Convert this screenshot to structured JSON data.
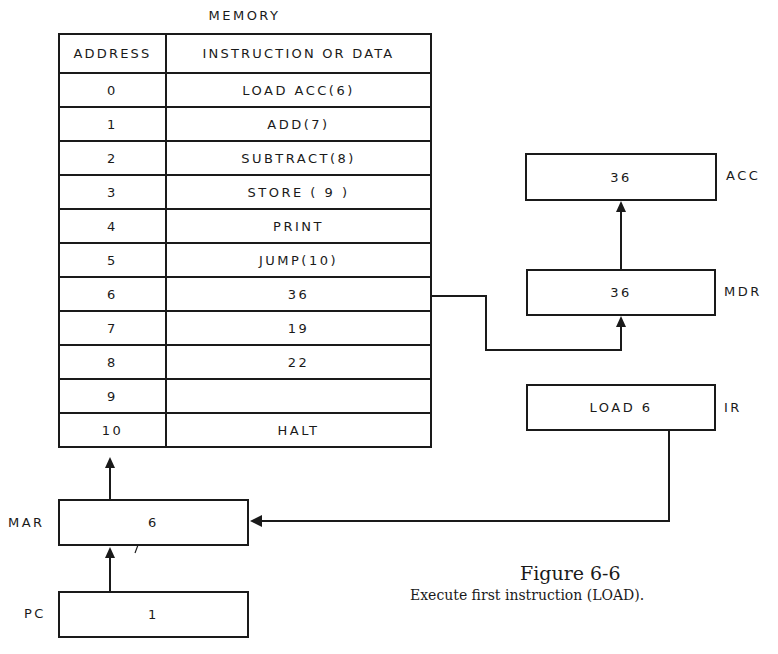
{
  "memory": {
    "title": "MEMORY",
    "headers": {
      "address": "ADDRESS",
      "content": "INSTRUCTION OR DATA"
    },
    "rows": [
      {
        "address": "0",
        "content": "LOAD ACC(6)"
      },
      {
        "address": "1",
        "content": "ADD(7)"
      },
      {
        "address": "2",
        "content": "SUBTRACT(8)"
      },
      {
        "address": "3",
        "content": "STORE ( 9 )"
      },
      {
        "address": "4",
        "content": "PRINT"
      },
      {
        "address": "5",
        "content": "JUMP(10)"
      },
      {
        "address": "6",
        "content": "36"
      },
      {
        "address": "7",
        "content": "19"
      },
      {
        "address": "8",
        "content": "22"
      },
      {
        "address": "9",
        "content": ""
      },
      {
        "address": "10",
        "content": "HALT"
      }
    ]
  },
  "registers": {
    "acc": {
      "label": "ACC",
      "value": "36"
    },
    "mdr": {
      "label": "MDR",
      "value": "36"
    },
    "ir": {
      "label": "IR",
      "value": "LOAD 6"
    },
    "mar": {
      "label": "MAR",
      "value": "6"
    },
    "pc": {
      "label": "PC",
      "value": "1"
    }
  },
  "figure": {
    "title": "Figure 6-6",
    "caption": "Execute first instruction (LOAD)."
  },
  "colors": {
    "ink": "#1a1a1a",
    "background": "#ffffff"
  }
}
